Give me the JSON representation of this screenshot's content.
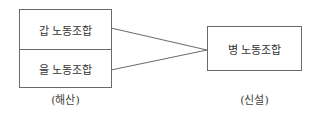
{
  "diagram": {
    "left_group": {
      "boxes": [
        {
          "label": "갑 노동조합"
        },
        {
          "label": "을 노동조합"
        }
      ],
      "caption": "(해산)"
    },
    "right_group": {
      "box": {
        "label": "병 노동조합"
      },
      "caption": "(신설)"
    },
    "connectors": [
      {
        "from": "갑 노동조합",
        "to": "병 노동조합"
      },
      {
        "from": "을 노동조합",
        "to": "병 노동조합"
      }
    ],
    "colors": {
      "border": "#6a6a6a",
      "text": "#333333",
      "background": "#ffffff"
    }
  }
}
